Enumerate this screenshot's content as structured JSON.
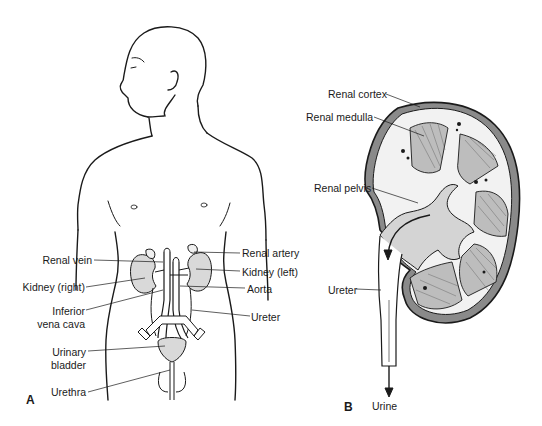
{
  "figure": {
    "panels": [
      {
        "id": "A",
        "letter": "A",
        "subject": "urinary-system-in-body",
        "labels": {
          "renal_vein": "Renal vein",
          "kidney_right": "Kidney (right)",
          "inferior_vena_cava_1": "Inferior",
          "inferior_vena_cava_2": "vena cava",
          "urinary_bladder_1": "Urinary",
          "urinary_bladder_2": "bladder",
          "urethra": "Urethra",
          "renal_artery": "Renal artery",
          "kidney_left": "Kidney (left)",
          "aorta": "Aorta",
          "ureter": "Ureter"
        }
      },
      {
        "id": "B",
        "letter": "B",
        "subject": "kidney-cross-section",
        "labels": {
          "renal_cortex": "Renal cortex",
          "renal_medulla": "Renal medulla",
          "renal_pelvis": "Renal pelvis",
          "ureter": "Ureter",
          "urine": "Urine"
        }
      }
    ],
    "colors": {
      "line": "#1a1a1a",
      "organ_fill": "#d9d9d9",
      "organ_dark": "#9a9a9a",
      "cortex_fill": "#f2f2f2",
      "background": "#ffffff"
    }
  }
}
